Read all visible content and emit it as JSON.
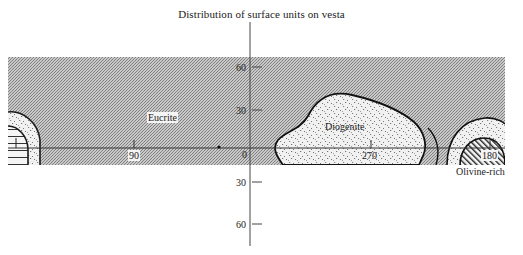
{
  "title": "Distribution of surface units on vesta",
  "map": {
    "band": {
      "x_start": 8,
      "x_end": 505,
      "y_top": 57,
      "y_bottom": 165
    },
    "equator_y": 148,
    "colors": {
      "background": "#ffffff",
      "band_fill": "#bdbdbd",
      "band_dither": "#8c8c8c",
      "outline": "#1a1a1a",
      "diogenite_fill": "#f2f2f2",
      "axis": "#333333"
    },
    "latitude_axis": {
      "x": 250,
      "ticks": [
        {
          "label": "60",
          "y": 67
        },
        {
          "label": "30",
          "y": 110
        },
        {
          "label": "0",
          "y": 154
        },
        {
          "label": "30",
          "y": 182
        },
        {
          "label": "60",
          "y": 224
        }
      ]
    },
    "longitude_ticks": [
      {
        "label": "90",
        "x": 135
      },
      {
        "label": "270",
        "x": 372
      },
      {
        "label": "180",
        "x": 488
      }
    ],
    "units": [
      {
        "name": "Eucrite",
        "pattern": "fine-gray-dither"
      },
      {
        "name": "Diogenite",
        "pattern": "stipple"
      },
      {
        "name": "Olivine-rich",
        "pattern": "diagonal-hatch"
      }
    ]
  }
}
